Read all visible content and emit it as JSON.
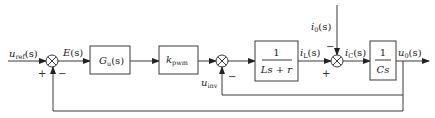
{
  "diagram": {
    "type": "control-block-diagram",
    "colors": {
      "line": "#3a3a3a",
      "text": "#222222",
      "background": "#ffffff"
    },
    "signals": {
      "input": {
        "base": "u",
        "sub": "ref",
        "arg": "(s)"
      },
      "error": {
        "base": "E",
        "sub": "",
        "arg": "(s)"
      },
      "inverter": {
        "base": "u",
        "sub": "inv",
        "arg": ""
      },
      "inductor_current": {
        "base": "i",
        "sub": "L",
        "arg": "(s)"
      },
      "load_current": {
        "base": "i",
        "sub": "0",
        "arg": "(s)"
      },
      "capacitor_current": {
        "base": "i",
        "sub": "C",
        "arg": "(s)"
      },
      "output": {
        "base": "u",
        "sub": "0",
        "arg": "(s)"
      }
    },
    "blocks": [
      {
        "id": "controller",
        "base": "G",
        "sub": "u",
        "arg": "(s)"
      },
      {
        "id": "pwm_gain",
        "base": "k",
        "sub": "pwm",
        "arg": ""
      },
      {
        "id": "inductor",
        "numerator": "1",
        "denominator": "Ls + r"
      },
      {
        "id": "capacitor",
        "numerator": "1",
        "denominator": "Cs"
      }
    ],
    "summing_junctions": [
      {
        "id": "sum1",
        "signs": {
          "left": "+",
          "bottom": "−"
        }
      },
      {
        "id": "sum2",
        "signs": {
          "bottom": "−"
        }
      },
      {
        "id": "sum3",
        "signs": {
          "left": "+",
          "top": "−"
        }
      }
    ]
  }
}
